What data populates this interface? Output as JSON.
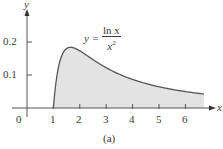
{
  "chart_data": {
    "type": "area",
    "title": "",
    "function": "y = ln x / x^2",
    "formula_label": {
      "lhs": "y =",
      "numerator": "ln x",
      "denominator": "x",
      "exponent": "2"
    },
    "caption": "(a)",
    "xlabel": "x",
    "ylabel": "y",
    "x_ticks": [
      "0",
      "1",
      "2",
      "3",
      "4",
      "5",
      "6"
    ],
    "y_ticks": [
      "0.1",
      "0.2"
    ],
    "xlim": [
      0,
      7
    ],
    "ylim": [
      0,
      0.25
    ],
    "shaded_region": {
      "from_x": 1,
      "to_x": 6.7,
      "fill": "#e3e3e3"
    },
    "x": [
      1,
      1.25,
      1.5,
      1.65,
      2,
      2.5,
      3,
      3.5,
      4,
      4.5,
      5,
      5.5,
      6,
      6.7
    ],
    "values": [
      0,
      0.143,
      0.18,
      0.184,
      0.173,
      0.147,
      0.122,
      0.102,
      0.087,
      0.074,
      0.064,
      0.056,
      0.05,
      0.042
    ],
    "grid": false,
    "legend": null,
    "colors": {
      "curve": "#555555",
      "fill": "#e3e3e3",
      "axis": "#555555",
      "text": "#3a3a3a"
    }
  }
}
